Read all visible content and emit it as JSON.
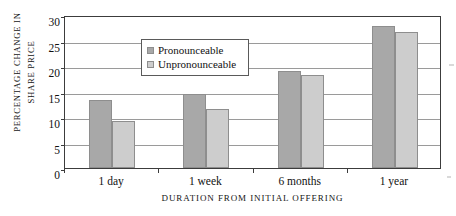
{
  "chart_data": {
    "type": "bar",
    "title": "",
    "subtitle": "",
    "xlabel": "DURATION FROM INITIAL OFFERING",
    "ylabel": "PERCENTAGE CHANGE IN SHARE PRICE",
    "ylabel_lines": [
      "PERCENTAGE CHANGE IN",
      "SHARE PRICE"
    ],
    "categories": [
      "1 day",
      "1 week",
      "6 months",
      "1 year"
    ],
    "series": [
      {
        "name": "Pronounceable",
        "color": "#a8a8a8",
        "values": [
          13.3,
          14.5,
          19.0,
          27.9
        ]
      },
      {
        "name": "Unpronounceable",
        "color": "#cdcdcd",
        "values": [
          9.2,
          11.6,
          18.3,
          26.6
        ]
      }
    ],
    "ylim": [
      0,
      30
    ],
    "yticks": [
      0,
      5,
      10,
      15,
      20,
      25,
      30
    ],
    "ytick_labels": [
      "0",
      "5",
      "10",
      "15",
      "20",
      "25",
      "30"
    ],
    "grid": true,
    "legend_position": "upper-left-inside"
  },
  "legend": {
    "items": [
      {
        "label": "Pronounceable",
        "color": "#a8a8a8"
      },
      {
        "label": "Unpronounceable",
        "color": "#cdcdcd"
      }
    ]
  }
}
